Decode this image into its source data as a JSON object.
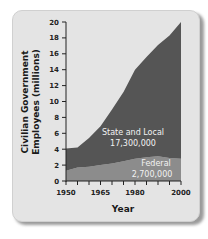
{
  "chart_data": {
    "type": "area",
    "stacked": true,
    "title": "",
    "xlabel": "Year",
    "ylabel": "Civilian Government Employees (millions)",
    "x": [
      1950,
      1955,
      1960,
      1965,
      1970,
      1975,
      1980,
      1985,
      1990,
      1995,
      2000
    ],
    "series": [
      {
        "name": "Federal",
        "label": "Federal",
        "value_label": "2,700,000",
        "color": "#8c8c8c",
        "values": [
          1.3,
          1.7,
          1.8,
          2.0,
          2.2,
          2.5,
          2.8,
          3.0,
          3.1,
          2.9,
          2.8
        ]
      },
      {
        "name": "State and Local",
        "label": "State and Local",
        "value_label": "17,300,000",
        "color": "#555555",
        "values": [
          2.8,
          2.5,
          3.6,
          4.9,
          6.8,
          8.7,
          11.2,
          12.6,
          14.0,
          15.4,
          17.2
        ]
      }
    ],
    "totals": [
      4.1,
      4.2,
      5.4,
      6.9,
      9.0,
      11.2,
      14.0,
      15.6,
      17.1,
      18.3,
      20.0
    ],
    "yticks": [
      0,
      2,
      4,
      6,
      8,
      10,
      12,
      14,
      16,
      18,
      20
    ],
    "xtick_labels": [
      "1950",
      "1965",
      "1980",
      "2000"
    ],
    "xticks_minor_every": 5,
    "ylim": [
      0,
      20
    ],
    "xlim": [
      1950,
      2000
    ],
    "grid": false,
    "legend": "inline labels"
  },
  "labels": {
    "ylabel_line1": "Civilian Government",
    "ylabel_line2": "Employees (millions)",
    "xlabel": "Year",
    "state_local_name": "State and Local",
    "state_local_value": "17,300,000",
    "federal_name": "Federal",
    "federal_value": "2,700,000"
  }
}
